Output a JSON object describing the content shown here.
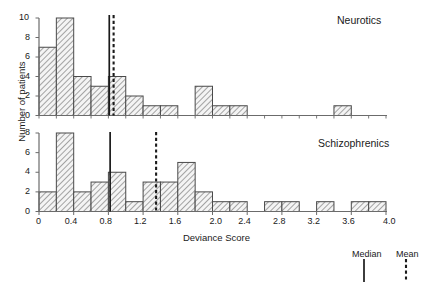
{
  "figure": {
    "xlabel": "Deviance Score",
    "ylabel": "Number of patients",
    "panel_titles": {
      "top": "Neurotics",
      "bottom": "Schizophrenics"
    },
    "legend": {
      "median_label": "Median",
      "mean_label": "Mean"
    },
    "xticks": [
      "0",
      "0.4",
      "0.8",
      "1.2",
      "1.6",
      "2.0",
      "2.4",
      "2.8",
      "3.2",
      "3.6",
      "4.0"
    ],
    "yticks_top": [
      "0",
      "2",
      "4",
      "6",
      "8",
      "10"
    ],
    "yticks_bottom": [
      "0",
      "2",
      "4",
      "6",
      "8"
    ],
    "colors": {
      "axis": "#6b6b6b",
      "bar_edge": "#4a4a4a",
      "bar_hatch": "#8c8c8c",
      "bar_fill": "#f2f2f2",
      "marker_line": "#1a1a1a",
      "text": "#1a1a1a"
    }
  },
  "chart_data": [
    {
      "type": "bar",
      "title": "Neurotics",
      "xlabel": "Deviance Score",
      "ylabel": "Number of patients",
      "bin_width": 0.2,
      "xlim": [
        0,
        4.0
      ],
      "ylim": [
        0,
        10
      ],
      "grid": false,
      "legend_position": "bottom-right",
      "categories": [
        "0.0-0.2",
        "0.2-0.4",
        "0.4-0.6",
        "0.6-0.8",
        "0.8-1.0",
        "1.0-1.2",
        "1.2-1.4",
        "1.4-1.6",
        "1.6-1.8",
        "1.8-2.0",
        "2.0-2.2",
        "2.2-2.4",
        "2.4-2.6",
        "2.6-2.8",
        "2.8-3.0",
        "3.0-3.2",
        "3.2-3.4",
        "3.4-3.6",
        "3.6-3.8",
        "3.8-4.0"
      ],
      "values": [
        7,
        10,
        4,
        3,
        4,
        2,
        1,
        1,
        0,
        3,
        1,
        1,
        0,
        0,
        0,
        0,
        0,
        1,
        0,
        0
      ],
      "markers": {
        "median": 0.81,
        "mean": 0.86
      }
    },
    {
      "type": "bar",
      "title": "Schizophrenics",
      "xlabel": "Deviance Score",
      "ylabel": "Number of patients",
      "bin_width": 0.2,
      "xlim": [
        0,
        4.0
      ],
      "ylim": [
        0,
        8
      ],
      "grid": false,
      "legend_position": "bottom-right",
      "categories": [
        "0.0-0.2",
        "0.2-0.4",
        "0.4-0.6",
        "0.6-0.8",
        "0.8-1.0",
        "1.0-1.2",
        "1.2-1.4",
        "1.4-1.6",
        "1.6-1.8",
        "1.8-2.0",
        "2.0-2.2",
        "2.2-2.4",
        "2.4-2.6",
        "2.6-2.8",
        "2.8-3.0",
        "3.0-3.2",
        "3.2-3.4",
        "3.4-3.6",
        "3.6-3.8",
        "3.8-4.0"
      ],
      "values": [
        2,
        8,
        2,
        3,
        4,
        1,
        3,
        3,
        5,
        2,
        1,
        1,
        0,
        1,
        1,
        0,
        1,
        0,
        1,
        1
      ],
      "markers": {
        "median": 0.82,
        "mean": 1.35
      }
    }
  ]
}
